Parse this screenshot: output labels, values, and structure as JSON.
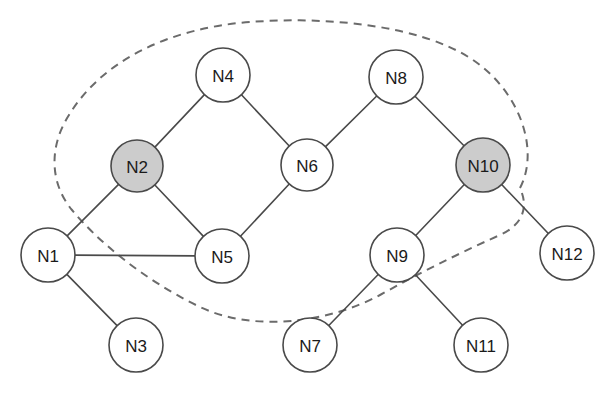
{
  "diagram": {
    "canvas": {
      "width": 616,
      "height": 399,
      "background": "#ffffff"
    },
    "style": {
      "node_fill_default": "#ffffff",
      "node_fill_highlight": "#cccccc",
      "node_stroke": "#4a4a4a",
      "edge_stroke": "#4a4a4a",
      "region_stroke": "#6b6b6b",
      "label_color": "#1a1a1a"
    },
    "nodes": [
      {
        "id": "N1",
        "label": "N1",
        "cx": 48,
        "cy": 255,
        "r": 27,
        "highlighted": false
      },
      {
        "id": "N2",
        "label": "N2",
        "cx": 137,
        "cy": 166,
        "r": 26,
        "highlighted": true
      },
      {
        "id": "N3",
        "label": "N3",
        "cx": 136,
        "cy": 345,
        "r": 27,
        "highlighted": false
      },
      {
        "id": "N4",
        "label": "N4",
        "cx": 223,
        "cy": 75,
        "r": 27,
        "highlighted": false
      },
      {
        "id": "N5",
        "label": "N5",
        "cx": 222,
        "cy": 256,
        "r": 27,
        "highlighted": false
      },
      {
        "id": "N6",
        "label": "N6",
        "cx": 307,
        "cy": 165,
        "r": 26,
        "highlighted": false
      },
      {
        "id": "N7",
        "label": "N7",
        "cx": 310,
        "cy": 345,
        "r": 27,
        "highlighted": false
      },
      {
        "id": "N8",
        "label": "N8",
        "cx": 396,
        "cy": 77,
        "r": 27,
        "highlighted": false
      },
      {
        "id": "N9",
        "label": "N9",
        "cx": 397,
        "cy": 255,
        "r": 27,
        "highlighted": false
      },
      {
        "id": "N10",
        "label": "N10",
        "cx": 483,
        "cy": 165,
        "r": 27,
        "highlighted": true
      },
      {
        "id": "N11",
        "label": "N11",
        "cx": 481,
        "cy": 345,
        "r": 27,
        "highlighted": false
      },
      {
        "id": "N12",
        "label": "N12",
        "cx": 567,
        "cy": 253,
        "r": 27,
        "highlighted": false
      }
    ],
    "edges": [
      {
        "from": "N1",
        "to": "N2"
      },
      {
        "from": "N1",
        "to": "N5"
      },
      {
        "from": "N1",
        "to": "N3"
      },
      {
        "from": "N2",
        "to": "N4"
      },
      {
        "from": "N2",
        "to": "N5"
      },
      {
        "from": "N4",
        "to": "N6"
      },
      {
        "from": "N5",
        "to": "N6"
      },
      {
        "from": "N6",
        "to": "N8"
      },
      {
        "from": "N8",
        "to": "N10"
      },
      {
        "from": "N10",
        "to": "N9"
      },
      {
        "from": "N10",
        "to": "N12"
      },
      {
        "from": "N9",
        "to": "N7"
      },
      {
        "from": "N9",
        "to": "N11"
      }
    ],
    "region": {
      "name": "dashed-selection-boundary",
      "dash_pattern": "8 6",
      "enclosed_nodes": [
        "N2",
        "N4",
        "N6",
        "N8",
        "N10"
      ],
      "path": "M 520 188 C 540 150 520 90 470 58 C 420 26 330 16 250 22 C 170 28 100 60 66 120 C 48 152 52 186 72 210 C 95 238 140 278 200 307 C 255 333 330 322 380 295 C 420 273 455 255 500 235 C 520 226 530 210 520 188 Z"
    }
  }
}
